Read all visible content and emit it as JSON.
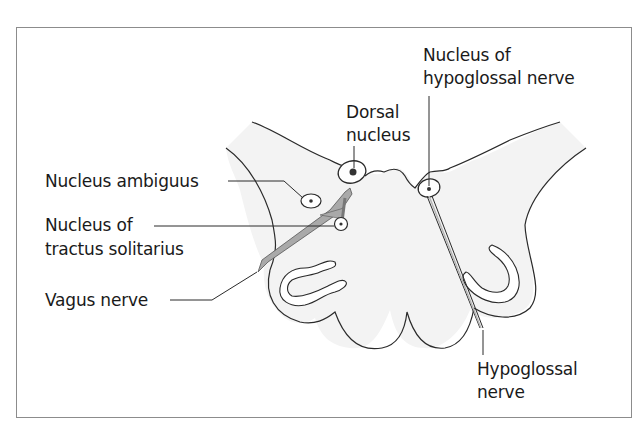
{
  "diagram": {
    "colors": {
      "frame": "#8c8c8c",
      "outline": "#2a2a2a",
      "fill": "#f3f3f3",
      "nerve": "#8a8a8a",
      "text": "#1a1a1a"
    },
    "labels": {
      "nucleus_ambiguus": "Nucleus ambiguus",
      "nucleus_tractus_line1": "Nucleus of",
      "nucleus_tractus_line2": "tractus solitarius",
      "vagus_nerve": "Vagus nerve",
      "dorsal_line1": "Dorsal",
      "dorsal_line2": "nucleus",
      "hypoglossal_nucleus_line1": "Nucleus of",
      "hypoglossal_nucleus_line2": "hypoglossal nerve",
      "hypoglossal_nerve_line1": "Hypoglossal",
      "hypoglossal_nerve_line2": "nerve"
    }
  }
}
